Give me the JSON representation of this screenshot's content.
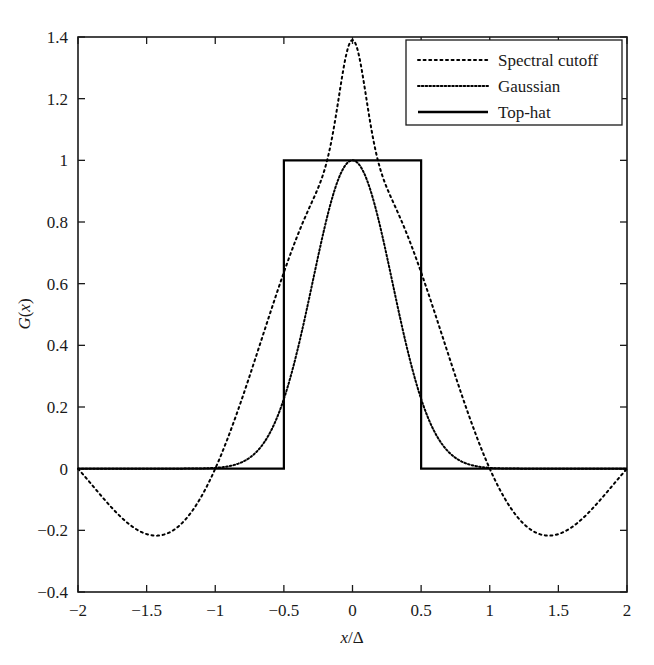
{
  "chart_data": {
    "type": "line",
    "title": "",
    "xlabel": "x/Δ",
    "ylabel": "G(x)",
    "xlim": [
      -2,
      2
    ],
    "ylim": [
      -0.4,
      1.4
    ],
    "grid": false,
    "legend_position": "top-right",
    "xticks": [
      -2,
      -1.5,
      -1,
      -0.5,
      0,
      0.5,
      1,
      1.5,
      2
    ],
    "xticklabels": [
      "−2",
      "−1.5",
      "−1",
      "−0.5",
      "0",
      "0.5",
      "1",
      "1.5",
      "2"
    ],
    "yticks": [
      -0.4,
      -0.2,
      0,
      0.2,
      0.4,
      0.6,
      0.8,
      1,
      1.2,
      1.4
    ],
    "yticklabels": [
      "−0.4",
      "−0.2",
      "0",
      "0.2",
      "0.4",
      "0.6",
      "0.8",
      "1",
      "1.2",
      "1.4"
    ],
    "series": [
      {
        "name": "Spectral cutoff",
        "style": "dotted",
        "color": "#000000",
        "note": "sinc: sin(pi*x)/(pi*x), peak 1.39 at x=0, zeros at x=+-1 and +-2, side lobe minimum -0.215 near x=+-1.43",
        "peak": 1.39,
        "zeros": [
          -2,
          -1,
          1,
          2
        ],
        "sidelobe_min": -0.215,
        "x": [
          -2,
          -1.9,
          -1.8,
          -1.7,
          -1.6,
          -1.5,
          -1.43,
          -1.4,
          -1.3,
          -1.2,
          -1.1,
          -1,
          -0.9,
          -0.8,
          -0.7,
          -0.6,
          -0.5,
          -0.4,
          -0.3,
          -0.2,
          -0.1,
          0,
          0.1,
          0.2,
          0.3,
          0.4,
          0.5,
          0.6,
          0.7,
          0.8,
          0.9,
          1,
          1.1,
          1.2,
          1.3,
          1.4,
          1.43,
          1.5,
          1.6,
          1.7,
          1.8,
          1.9,
          2
        ],
        "y": [
          0,
          -0.072,
          -0.131,
          -0.175,
          -0.202,
          -0.212,
          -0.215,
          -0.214,
          -0.2,
          -0.172,
          -0.13,
          -0.077,
          0,
          0.094,
          0.204,
          0.328,
          0.46,
          0.599,
          0.739,
          0.877,
          1.003,
          1.39,
          1.003,
          0.877,
          0.739,
          0.599,
          0.46,
          0.328,
          0.204,
          0.094,
          0,
          -0.077,
          -0.13,
          -0.172,
          -0.2,
          -0.214,
          -0.215,
          -0.212,
          -0.202,
          -0.175,
          -0.131,
          -0.072,
          0
        ]
      },
      {
        "name": "Gaussian",
        "style": "fine-dotted",
        "color": "#000000",
        "note": "Gaussian bell, peak 1.0 at x=0, sigma approx 0.29, decays to ~0 by |x| = 1.3",
        "peak": 1.0,
        "sigma": 0.29,
        "x": [
          -1.5,
          -1.4,
          -1.3,
          -1.2,
          -1.1,
          -1,
          -0.9,
          -0.8,
          -0.7,
          -0.6,
          -0.5,
          -0.4,
          -0.3,
          -0.2,
          -0.1,
          0,
          0.1,
          0.2,
          0.3,
          0.4,
          0.5,
          0.6,
          0.7,
          0.8,
          0.9,
          1,
          1.1,
          1.2,
          1.3,
          1.4,
          1.5
        ],
        "y": [
          0.0,
          0.0,
          0.002,
          0.005,
          0.011,
          0.028,
          0.064,
          0.128,
          0.236,
          0.391,
          0.582,
          0.775,
          0.921,
          0.99,
          1.0,
          1.0,
          1.0,
          0.99,
          0.921,
          0.775,
          0.582,
          0.391,
          0.236,
          0.128,
          0.064,
          0.028,
          0.011,
          0.005,
          0.002,
          0.0,
          0.0
        ]
      },
      {
        "name": "Top-hat",
        "style": "solid",
        "color": "#000000",
        "note": "rectangle of height 1 between x = -0.5 and x = 0.5, zero elsewhere",
        "x": [
          -2,
          -0.5,
          -0.5,
          0.5,
          0.5,
          2
        ],
        "y": [
          0,
          0,
          1,
          1,
          0,
          0
        ]
      }
    ]
  },
  "legend": {
    "entries": [
      {
        "label": "Spectral cutoff",
        "style": "dotted"
      },
      {
        "label": "Gaussian",
        "style": "fine-dotted"
      },
      {
        "label": "Top-hat",
        "style": "solid"
      }
    ]
  },
  "axes": {
    "x_title_italic": "x",
    "x_title_sep": "/",
    "x_title_delta": "Δ",
    "y_title_g": "G",
    "y_title_paren_open": "(",
    "y_title_var": "x",
    "y_title_paren_close": ")"
  }
}
